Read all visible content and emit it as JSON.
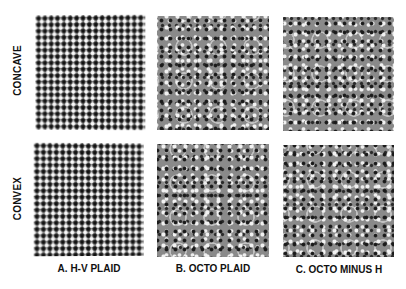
{
  "figure": {
    "rows": [
      {
        "label": "CONCAVE"
      },
      {
        "label": "CONVEX"
      }
    ],
    "columns": [
      {
        "label": "A. H-V PLAID",
        "pattern": "h-v-plaid"
      },
      {
        "label": "B. OCTO PLAID",
        "pattern": "octo-plaid"
      },
      {
        "label": "C. OCTO MINUS H",
        "pattern": "octo-minus-h"
      }
    ],
    "colors": {
      "background": "#ffffff",
      "label_text": "#111111",
      "pattern_dark": "#111111",
      "pattern_light": "#fafafa",
      "pattern_mid_gray": "#8a8a8a"
    }
  }
}
